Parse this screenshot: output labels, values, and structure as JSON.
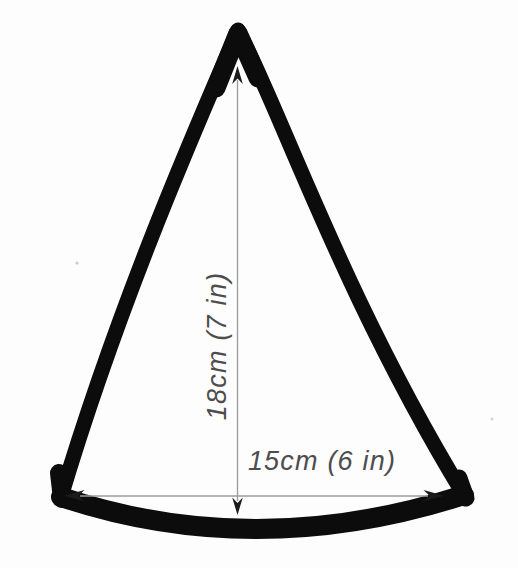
{
  "figure": {
    "kind": "hand-drawn cone pattern piece with dimension arrows",
    "labels": {
      "height": "18cm (7 in)",
      "width": "15cm (6 in)"
    },
    "measurements": {
      "height": {
        "cm": 18,
        "inches": 7
      },
      "width": {
        "cm": 15,
        "inches": 6
      }
    },
    "colors": {
      "background": "#fdfdfd",
      "outline": "#0c0c0c",
      "dimension_line": "#9b9b9b",
      "arrowhead": "#1b1b1b",
      "label_text": "#4d4d4d"
    }
  }
}
